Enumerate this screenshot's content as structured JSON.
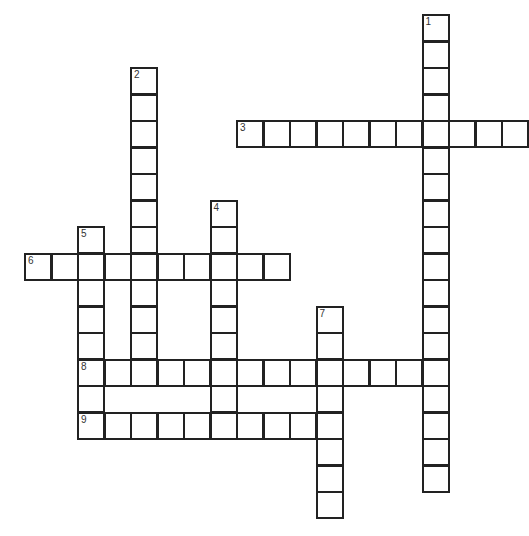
{
  "puzzle": {
    "type": "crossword",
    "cell_size": 26.5,
    "origin": {
      "x": 24,
      "y": 14
    },
    "words": [
      {
        "number": "1",
        "direction": "down",
        "col": 15,
        "row": 0,
        "length": 18
      },
      {
        "number": "2",
        "direction": "down",
        "col": 4,
        "row": 2,
        "length": 12
      },
      {
        "number": "3",
        "direction": "across",
        "col": 8,
        "row": 4,
        "length": 11
      },
      {
        "number": "4",
        "direction": "down",
        "col": 7,
        "row": 7,
        "length": 8
      },
      {
        "number": "5",
        "direction": "down",
        "col": 2,
        "row": 8,
        "length": 8
      },
      {
        "number": "6",
        "direction": "across",
        "col": 0,
        "row": 9,
        "length": 10
      },
      {
        "number": "7",
        "direction": "down",
        "col": 11,
        "row": 11,
        "length": 8
      },
      {
        "number": "8",
        "direction": "across",
        "col": 2,
        "row": 13,
        "length": 14
      },
      {
        "number": "9",
        "direction": "across",
        "col": 2,
        "row": 15,
        "length": 10
      }
    ]
  }
}
